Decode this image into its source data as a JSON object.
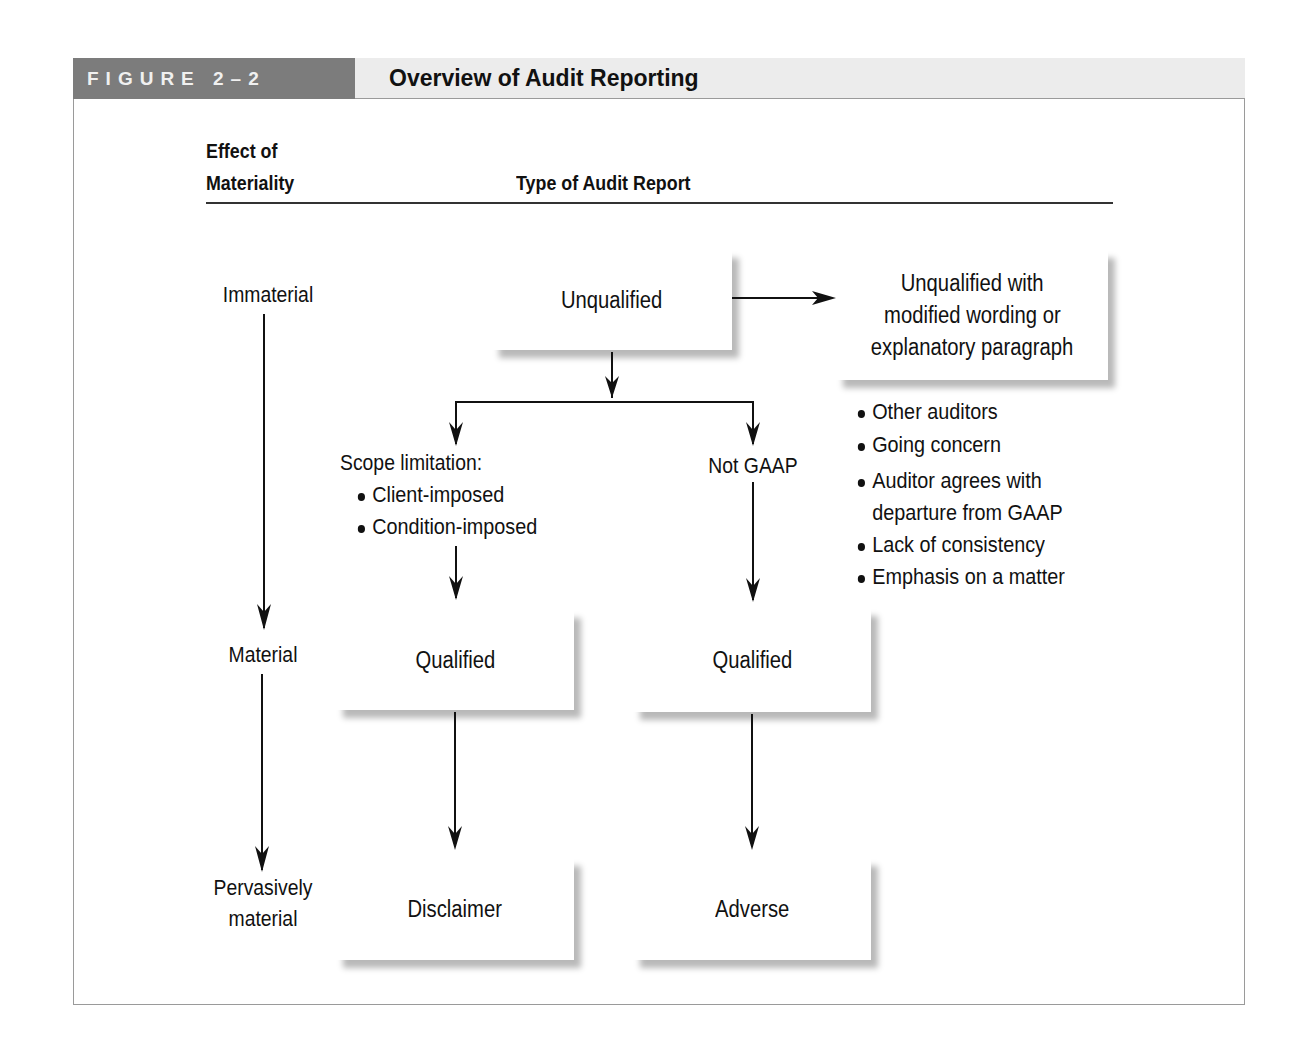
{
  "figure": {
    "number_label": "FIGURE 2–2",
    "title": "Overview of Audit Reporting",
    "colors": {
      "label_bg": "#7c7c7c",
      "title_bg": "#ececec",
      "border": "#9a9a9a",
      "ink": "#111111"
    }
  },
  "columns": {
    "materiality_header_line1": "Effect of",
    "materiality_header_line2": "Materiality",
    "report_header": "Type of Audit Report"
  },
  "materiality_levels": {
    "immaterial": "Immaterial",
    "material": "Material",
    "pervasive_line1": "Pervasively",
    "pervasive_line2": "material"
  },
  "nodes": {
    "unqualified": "Unqualified",
    "unqualified_modified_line1": "Unqualified with",
    "unqualified_modified_line2": "modified wording or",
    "unqualified_modified_line3": "explanatory paragraph",
    "scope_limitation": "Scope limitation:",
    "not_gaap": "Not GAAP",
    "qualified_scope": "Qualified",
    "qualified_gaap": "Qualified",
    "disclaimer": "Disclaimer",
    "adverse": "Adverse"
  },
  "scope_limitation_items": [
    "Client-imposed",
    "Condition-imposed"
  ],
  "modified_wording_reasons": {
    "item0": "Other auditors",
    "item1": "Going concern",
    "item2_line1": "Auditor agrees with",
    "item2_line2": "departure from GAAP",
    "item3": "Lack of consistency",
    "item4": "Emphasis on a matter"
  }
}
